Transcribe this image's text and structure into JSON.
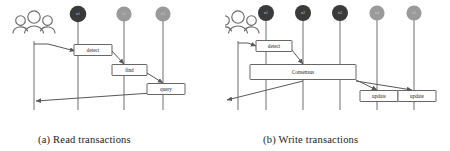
{
  "figure": {
    "background": "#ffffff",
    "line_color": "#585858",
    "node_dark_color": "#3a3a3a",
    "node_light_color": "#9a9a9a",
    "box_fill": "#ffffff",
    "box_stroke": "#555555",
    "text_color": "#1a1a1a"
  },
  "panels": [
    {
      "id": "a",
      "caption": "(a) Read transactions",
      "actor": {
        "name": "users-actor",
        "label": ""
      },
      "nodes": [
        {
          "label": "n1",
          "shade": "dark",
          "x": 78
        },
        {
          "label": "n2",
          "shade": "light",
          "x": 124
        },
        {
          "label": "n3",
          "shade": "light",
          "x": 163
        }
      ],
      "messages": [
        {
          "label": "detect",
          "x": 93,
          "y": 48
        },
        {
          "label": "find",
          "x": 129,
          "y": 70
        },
        {
          "label": "query",
          "x": 166,
          "y": 89
        }
      ]
    },
    {
      "id": "b",
      "caption": "(b) Write transactions",
      "actor": {
        "name": "users-actor",
        "label": ""
      },
      "nodes": [
        {
          "label": "n1",
          "shade": "dark",
          "x": 266
        },
        {
          "label": "n2",
          "shade": "dark",
          "x": 303
        },
        {
          "label": "n3",
          "shade": "dark",
          "x": 340
        },
        {
          "label": "n4",
          "shade": "light",
          "x": 377
        },
        {
          "label": "n5",
          "shade": "light",
          "x": 414
        }
      ],
      "messages": [
        {
          "label": "detect",
          "x": 274,
          "y": 46
        },
        {
          "label": "Consensus",
          "x": 303,
          "y": 73
        },
        {
          "label": "update",
          "x": 379,
          "y": 96
        },
        {
          "label": "update",
          "x": 417,
          "y": 96
        }
      ]
    }
  ]
}
